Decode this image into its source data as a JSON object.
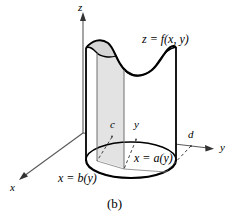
{
  "figure": {
    "caption": "(b)",
    "colors": {
      "stroke": "#000000",
      "axis": "#555555",
      "slab_fill": "#e3e3e3",
      "top_fill": "#d8d8d8",
      "background": "#ffffff"
    },
    "axes": [
      {
        "name": "z-axis",
        "label": "z"
      },
      {
        "name": "y-axis",
        "label": "y"
      },
      {
        "name": "x-axis",
        "label": "x"
      }
    ],
    "labels": {
      "z_axis": "z",
      "y_axis": "y",
      "x_axis": "x",
      "surface": "z = f(x, y)",
      "point_c": "c",
      "point_y": "y",
      "point_d": "d",
      "boundary_right": "x = a(y)",
      "boundary_left": "x = b(y)"
    }
  }
}
